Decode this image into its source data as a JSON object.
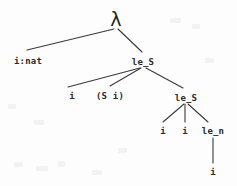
{
  "figure": {
    "type": "tree-diagram",
    "width": 237,
    "height": 186,
    "background_color": "#fdfdfd",
    "stroke_color": "#3a3a3a",
    "text_color": "#2a2a2a"
  },
  "nodes": [
    {
      "id": "root",
      "label": "λ",
      "x": 116,
      "y": 19,
      "kind": "lambda"
    },
    {
      "id": "inat",
      "label": "i:nat",
      "x": 28,
      "y": 61,
      "kind": "text"
    },
    {
      "id": "leS1",
      "label": "le_S",
      "x": 143,
      "y": 62,
      "kind": "text"
    },
    {
      "id": "i1",
      "label": "i",
      "x": 72,
      "y": 96,
      "kind": "text"
    },
    {
      "id": "si",
      "label": "(S i)",
      "x": 110,
      "y": 96,
      "kind": "text"
    },
    {
      "id": "leS2",
      "label": "le_S",
      "x": 186,
      "y": 98,
      "kind": "text"
    },
    {
      "id": "i2",
      "label": "i",
      "x": 163,
      "y": 131,
      "kind": "text"
    },
    {
      "id": "i3",
      "label": "i",
      "x": 185,
      "y": 131,
      "kind": "text"
    },
    {
      "id": "len",
      "label": "le_n",
      "x": 213,
      "y": 131,
      "kind": "text"
    },
    {
      "id": "i4",
      "label": "i",
      "x": 213,
      "y": 172,
      "kind": "text"
    }
  ],
  "edges": [
    {
      "from": "root",
      "to": "inat",
      "x1": 114,
      "y1": 29,
      "x2": 27,
      "y2": 50
    },
    {
      "from": "root",
      "to": "leS1",
      "x1": 118,
      "y1": 29,
      "x2": 142,
      "y2": 52
    },
    {
      "from": "leS1",
      "to": "i1",
      "x1": 140,
      "y1": 68,
      "x2": 68,
      "y2": 87
    },
    {
      "from": "leS1",
      "to": "si",
      "x1": 141,
      "y1": 68,
      "x2": 110,
      "y2": 86
    },
    {
      "from": "leS1",
      "to": "leS2",
      "x1": 146,
      "y1": 68,
      "x2": 183,
      "y2": 88
    },
    {
      "from": "leS2",
      "to": "i2",
      "x1": 184,
      "y1": 104,
      "x2": 163,
      "y2": 122
    },
    {
      "from": "leS2",
      "to": "i3",
      "x1": 185,
      "y1": 104,
      "x2": 185,
      "y2": 122
    },
    {
      "from": "leS2",
      "to": "len",
      "x1": 188,
      "y1": 104,
      "x2": 208,
      "y2": 122
    },
    {
      "from": "len",
      "to": "i4",
      "x1": 213,
      "y1": 138,
      "x2": 213,
      "y2": 163
    }
  ],
  "labels": {
    "lambda_symbol": "λ",
    "binder": "i:nat",
    "relation_succ": "le_S",
    "relation_base": "le_n",
    "var": "i",
    "succ_app": "(S i)"
  }
}
